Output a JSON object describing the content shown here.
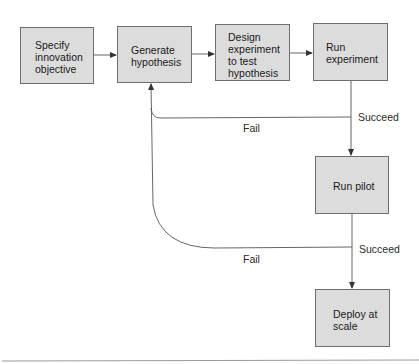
{
  "diagram": {
    "nodes": [
      {
        "id": "specify",
        "label": "Specify\ninnovation\nobjective"
      },
      {
        "id": "generate",
        "label": "Generate\nhypothesis"
      },
      {
        "id": "design",
        "label": "Design\nexperiment\nto test\nhypothesis"
      },
      {
        "id": "run_experiment",
        "label": "Run\nexperiment"
      },
      {
        "id": "run_pilot",
        "label": "Run pilot"
      },
      {
        "id": "deploy",
        "label": "Deploy at\nscale"
      }
    ],
    "edges": [
      {
        "from": "specify",
        "to": "generate",
        "label": ""
      },
      {
        "from": "generate",
        "to": "design",
        "label": ""
      },
      {
        "from": "design",
        "to": "run_experiment",
        "label": ""
      },
      {
        "from": "run_experiment",
        "to": "run_pilot",
        "label": "Succeed"
      },
      {
        "from": "run_experiment",
        "to": "generate",
        "label": "Fail"
      },
      {
        "from": "run_pilot",
        "to": "deploy",
        "label": "Succeed"
      },
      {
        "from": "run_pilot",
        "to": "generate",
        "label": "Fail"
      }
    ],
    "edge_labels": {
      "succeed_1": "Succeed",
      "fail_1": "Fail",
      "succeed_2": "Succeed",
      "fail_2": "Fail"
    },
    "colors": {
      "box_fill": "#dcdcdc",
      "box_border": "#6e6e6e",
      "line": "#555555"
    }
  }
}
